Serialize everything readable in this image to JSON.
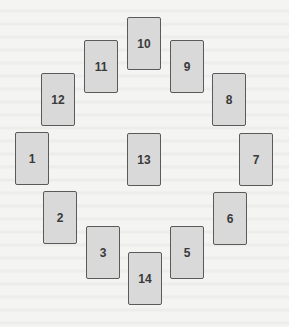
{
  "diagram": {
    "title": "",
    "cards": [
      {
        "label": "1"
      },
      {
        "label": "2"
      },
      {
        "label": "3"
      },
      {
        "label": "5"
      },
      {
        "label": "6"
      },
      {
        "label": "7"
      },
      {
        "label": "8"
      },
      {
        "label": "9"
      },
      {
        "label": "10"
      },
      {
        "label": "11"
      },
      {
        "label": "12"
      },
      {
        "label": "13"
      },
      {
        "label": "14"
      }
    ]
  },
  "colors": {
    "card_fill": "#d9d9d9",
    "card_border": "#5a5a5a",
    "label": "#3a3a3a",
    "background": "#f4f4f2"
  }
}
